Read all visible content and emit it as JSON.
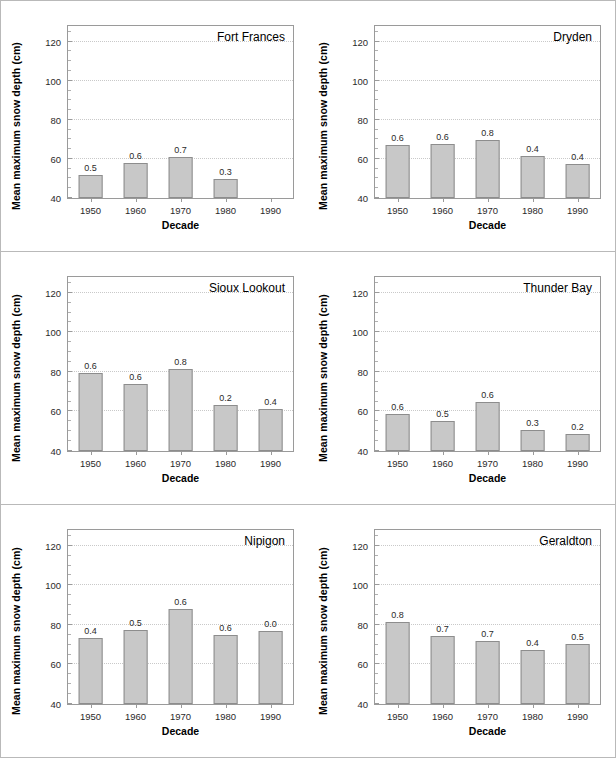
{
  "figure": {
    "axis_title_y": "Mean maximum snow depth (cm)",
    "axis_title_x": "Decade",
    "bar_color": "#c8c8c8",
    "bar_edge_color": "#8d8d8d",
    "grid_color": "#c9c9c9"
  },
  "chart_data": [
    {
      "type": "bar",
      "title": "Fort Frances",
      "xlabel": "Decade",
      "ylabel": "Mean maximum snow depth (cm)",
      "categories": [
        "1950",
        "1960",
        "1970",
        "1980",
        "1990"
      ],
      "values": [
        52,
        58,
        61,
        49.5,
        null
      ],
      "data_labels": [
        "0.5",
        "0.6",
        "0.7",
        "0.3",
        ""
      ],
      "ylim": [
        40,
        128
      ],
      "yticks": [
        40,
        60,
        80,
        100,
        120
      ],
      "grid": true,
      "legend": "none"
    },
    {
      "type": "bar",
      "title": "Dryden",
      "xlabel": "Decade",
      "ylabel": "Mean maximum snow depth (cm)",
      "categories": [
        "1950",
        "1960",
        "1970",
        "1980",
        "1990"
      ],
      "values": [
        67,
        67.5,
        69.5,
        61.5,
        57.5
      ],
      "data_labels": [
        "0.6",
        "0.6",
        "0.8",
        "0.4",
        "0.4"
      ],
      "ylim": [
        40,
        128
      ],
      "yticks": [
        40,
        60,
        80,
        100,
        120
      ],
      "grid": true,
      "legend": "none"
    },
    {
      "type": "bar",
      "title": "Sioux Lookout",
      "xlabel": "Decade",
      "ylabel": "Mean maximum snow depth (cm)",
      "categories": [
        "1950",
        "1960",
        "1970",
        "1980",
        "1990"
      ],
      "values": [
        79.5,
        74,
        81.5,
        63.5,
        61
      ],
      "data_labels": [
        "0.6",
        "0.6",
        "0.8",
        "0.2",
        "0.4"
      ],
      "ylim": [
        40,
        128
      ],
      "yticks": [
        40,
        60,
        80,
        100,
        120
      ],
      "grid": true,
      "legend": "none"
    },
    {
      "type": "bar",
      "title": "Thunder Bay",
      "xlabel": "Decade",
      "ylabel": "Mean maximum snow depth (cm)",
      "categories": [
        "1950",
        "1960",
        "1970",
        "1980",
        "1990"
      ],
      "values": [
        58.5,
        55,
        65,
        50.5,
        48.5
      ],
      "data_labels": [
        "0.6",
        "0.5",
        "0.6",
        "0.3",
        "0.2"
      ],
      "ylim": [
        40,
        128
      ],
      "yticks": [
        40,
        60,
        80,
        100,
        120
      ],
      "grid": true,
      "legend": "none"
    },
    {
      "type": "bar",
      "title": "Nipigon",
      "xlabel": "Decade",
      "ylabel": "Mean maximum snow depth (cm)",
      "categories": [
        "1950",
        "1960",
        "1970",
        "1980",
        "1990"
      ],
      "values": [
        73.5,
        77.5,
        88,
        75,
        77
      ],
      "data_labels": [
        "0.4",
        "0.5",
        "0.6",
        "0.6",
        "0.0"
      ],
      "ylim": [
        40,
        128
      ],
      "yticks": [
        40,
        60,
        80,
        100,
        120
      ],
      "grid": true,
      "legend": "none"
    },
    {
      "type": "bar",
      "title": "Geraldton",
      "xlabel": "Decade",
      "ylabel": "Mean maximum snow depth (cm)",
      "categories": [
        "1950",
        "1960",
        "1970",
        "1980",
        "1990"
      ],
      "values": [
        81.5,
        74.5,
        72,
        67.5,
        70.5
      ],
      "data_labels": [
        "0.8",
        "0.7",
        "0.7",
        "0.4",
        "0.5"
      ],
      "ylim": [
        40,
        128
      ],
      "yticks": [
        40,
        60,
        80,
        100,
        120
      ],
      "grid": true,
      "legend": "none"
    }
  ]
}
